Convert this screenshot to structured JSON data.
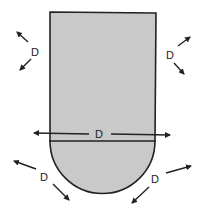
{
  "diagram": {
    "colors": {
      "fill": "#c9c9c9",
      "stroke": "#222222",
      "background": "#ffffff"
    },
    "labels": {
      "upper_left": "D",
      "upper_right": "D",
      "center": "D",
      "lower_left": "D",
      "lower_right": "D"
    }
  }
}
